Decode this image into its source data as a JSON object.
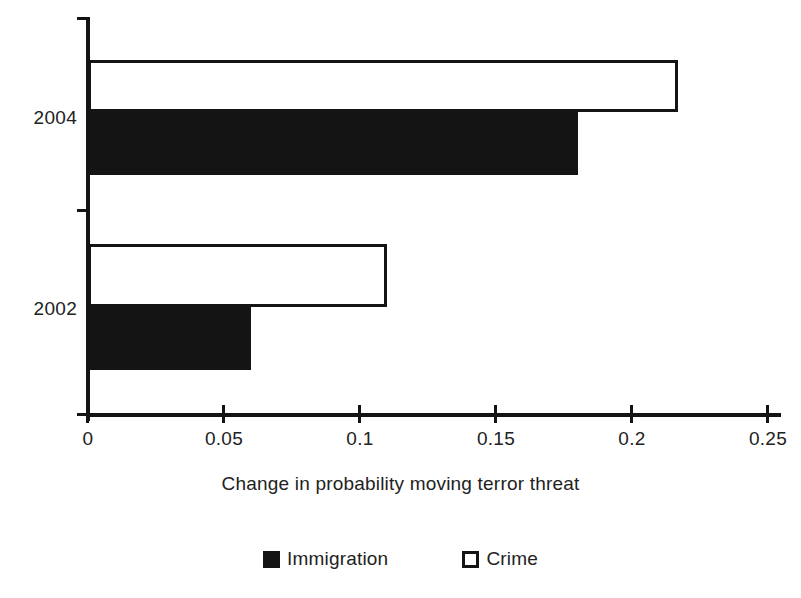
{
  "chart_data": {
    "type": "bar",
    "orientation": "horizontal",
    "title": "",
    "xlabel": "Change in probability moving terror threat",
    "ylabel": "",
    "categories": [
      "2002",
      "2004"
    ],
    "series": [
      {
        "name": "Immigration",
        "values": [
          0.06,
          0.18
        ],
        "fill": "#141414",
        "style": "filled"
      },
      {
        "name": "Crime",
        "values": [
          0.11,
          0.217
        ],
        "fill": "#ffffff",
        "style": "hollow"
      }
    ],
    "xlim": [
      0,
      0.25
    ],
    "xticks": [
      0,
      0.05,
      0.1,
      0.15,
      0.2,
      0.25
    ],
    "xtick_labels": [
      "0",
      "0.05",
      "0.1",
      "0.15",
      "0.2",
      "0.25"
    ],
    "grid": false,
    "legend": {
      "position": "bottom",
      "entries": [
        "Immigration",
        "Crime"
      ]
    }
  },
  "axis": {
    "x_title": "Change in probability moving terror threat",
    "tick_labels": [
      "0",
      "0.05",
      "0.1",
      "0.15",
      "0.2",
      "0.25"
    ],
    "category_labels": [
      "2004",
      "2002"
    ]
  },
  "legend": {
    "items": [
      {
        "label": "Immigration",
        "swatch": "filled-square-icon"
      },
      {
        "label": "Crime",
        "swatch": "hollow-square-icon"
      }
    ]
  },
  "colors": {
    "ink": "#141414",
    "background": "#ffffff"
  }
}
